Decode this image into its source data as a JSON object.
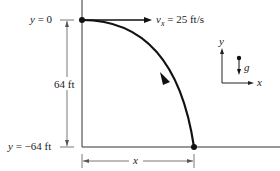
{
  "figure": {
    "type": "projectile-motion-diagram",
    "labels": {
      "y_top": {
        "var": "y",
        "eq": " = 0"
      },
      "y_bottom": {
        "var": "y",
        "eq": " = −64 ft"
      },
      "height": "64 ft",
      "velocity": {
        "var": "v",
        "sub": "x",
        "eq": " = 25 ft/s"
      },
      "horizontal_distance": "x",
      "axis_x": "x",
      "axis_y": "y",
      "gravity": "g"
    },
    "values": {
      "initial_height_ft": 0,
      "final_height_ft": -64,
      "drop_ft": 64,
      "horizontal_velocity_ft_per_s": 25
    },
    "colors": {
      "ink": "#1a1a1a",
      "dimension": "#555555",
      "background": "#ffffff"
    }
  }
}
